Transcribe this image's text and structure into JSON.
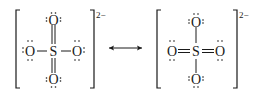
{
  "diagram": {
    "type": "resonance-structures",
    "arrow": "double-headed",
    "structures": [
      {
        "name": "left-structure",
        "central_atom": "S",
        "charge": "2−",
        "ligands": [
          {
            "position": "top",
            "atom": "O",
            "bond": "double",
            "lone_pairs": 2
          },
          {
            "position": "left",
            "atom": "O",
            "bond": "single",
            "lone_pairs": 3
          },
          {
            "position": "right",
            "atom": "O",
            "bond": "single",
            "lone_pairs": 3
          },
          {
            "position": "bottom",
            "atom": "O",
            "bond": "double",
            "lone_pairs": 2
          }
        ]
      },
      {
        "name": "right-structure",
        "central_atom": "S",
        "charge": "2−",
        "ligands": [
          {
            "position": "top",
            "atom": "O",
            "bond": "single",
            "lone_pairs": 3
          },
          {
            "position": "left",
            "atom": "O",
            "bond": "double",
            "lone_pairs": 2
          },
          {
            "position": "right",
            "atom": "O",
            "bond": "double",
            "lone_pairs": 2
          },
          {
            "position": "bottom",
            "atom": "O",
            "bond": "single",
            "lone_pairs": 3
          }
        ]
      }
    ]
  },
  "labels": {
    "central": "S",
    "oxygen": "O",
    "charge": "2−"
  },
  "colors": {
    "ink": "#1a1a1a",
    "background": "#ffffff"
  }
}
